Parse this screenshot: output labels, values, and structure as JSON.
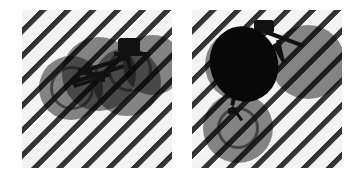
{
  "figure": {
    "canvas": {
      "width": 362,
      "height": 177,
      "background": "#ffffff"
    },
    "panel_count": 2
  },
  "palette": {
    "background": "#ffffff",
    "stripe_light": "#f4f4f4",
    "stripe_dark": "#313131",
    "proposal_fill": "#000000",
    "proposal_opacity": "0.46",
    "blob_fill": "#080808",
    "bicycle_fill": "#111111"
  },
  "stripe_pattern": {
    "name": "diagonal-stripes",
    "angle_deg": -45,
    "period_px": 17.6,
    "dark_band_px": 5,
    "light_band_px": 12
  },
  "panels": [
    {
      "id": "panel-left",
      "label": "Left panel",
      "x": 22,
      "y": 10,
      "width": 150,
      "height": 158,
      "proposals": [
        {
          "id": "prop-l1",
          "cx": 49,
          "cy": 78,
          "r": 32
        },
        {
          "id": "prop-l2",
          "cx": 77,
          "cy": 64,
          "r": 37
        },
        {
          "id": "prop-l3",
          "cx": 105,
          "cy": 72,
          "r": 34
        },
        {
          "id": "prop-l4",
          "cx": 131,
          "cy": 55,
          "r": 30
        }
      ],
      "blobs": [],
      "object_label": "bicycle"
    },
    {
      "id": "panel-right",
      "label": "Right panel",
      "x": 192,
      "y": 10,
      "width": 150,
      "height": 158,
      "proposals": [
        {
          "id": "prop-r1",
          "cx": 46,
          "cy": 118,
          "r": 35
        },
        {
          "id": "prop-r2",
          "cx": 49,
          "cy": 55,
          "r": 36
        },
        {
          "id": "prop-r3",
          "cx": 116,
          "cy": 52,
          "r": 37
        }
      ],
      "blobs": [
        {
          "id": "blob-r1",
          "cx": 52,
          "cy": 54,
          "rx": 34,
          "ry": 38,
          "rotate_deg": -18
        }
      ],
      "object_label": "bicycle"
    }
  ],
  "bicycle_left": {
    "name": "bicycle-silhouette-left",
    "parts": [
      {
        "id": "bl-rearwheel-rim",
        "type": "ring",
        "cx": 50,
        "cy": 78,
        "r": 22,
        "thickness": 3
      },
      {
        "id": "bl-frontwheel-rim",
        "type": "ring",
        "cx": 108,
        "cy": 60,
        "r": 22,
        "thickness": 3
      },
      {
        "id": "bl-toptube",
        "type": "stroke",
        "x1": 58,
        "y1": 62,
        "x2": 104,
        "y2": 48,
        "w": 4
      },
      {
        "id": "bl-downtube",
        "type": "stroke",
        "x1": 52,
        "y1": 72,
        "x2": 102,
        "y2": 56,
        "w": 4
      },
      {
        "id": "bl-seattube",
        "type": "stroke",
        "x1": 58,
        "y1": 62,
        "x2": 52,
        "y2": 76,
        "w": 4
      },
      {
        "id": "bl-chainstay",
        "type": "stroke",
        "x1": 52,
        "y1": 76,
        "x2": 88,
        "y2": 64,
        "w": 3
      },
      {
        "id": "bl-seatstay",
        "type": "stroke",
        "x1": 58,
        "y1": 60,
        "x2": 84,
        "y2": 66,
        "w": 3
      },
      {
        "id": "bl-forkblade",
        "type": "stroke",
        "x1": 104,
        "y1": 46,
        "x2": 110,
        "y2": 62,
        "w": 4
      },
      {
        "id": "bl-handlebar",
        "type": "stroke",
        "x1": 92,
        "y1": 44,
        "x2": 128,
        "y2": 44,
        "w": 4
      },
      {
        "id": "bl-saddle",
        "type": "blockA",
        "x": 56,
        "y": 58,
        "w": 14,
        "h": 7
      },
      {
        "id": "bl-headbox",
        "type": "blockB",
        "x": 96,
        "y": 28,
        "w": 22,
        "h": 14
      },
      {
        "id": "bl-stem",
        "type": "stroke",
        "x1": 106,
        "y1": 36,
        "x2": 106,
        "y2": 50,
        "w": 4
      },
      {
        "id": "bl-pedal",
        "type": "blockC",
        "x": 74,
        "y": 66,
        "w": 9,
        "h": 6
      }
    ]
  },
  "bicycle_right": {
    "name": "bicycle-silhouette-right",
    "parts": [
      {
        "id": "br-rearwheel-rim",
        "type": "ring",
        "cx": 46,
        "cy": 118,
        "r": 21,
        "thickness": 3
      },
      {
        "id": "br-toptube",
        "type": "stroke",
        "x1": 46,
        "y1": 76,
        "x2": 82,
        "y2": 38,
        "w": 4
      },
      {
        "id": "br-downtube",
        "type": "stroke",
        "x1": 40,
        "y1": 84,
        "x2": 80,
        "y2": 44,
        "w": 4
      },
      {
        "id": "br-seattube",
        "type": "stroke",
        "x1": 44,
        "y1": 80,
        "x2": 40,
        "y2": 96,
        "w": 4
      },
      {
        "id": "br-chainstay",
        "type": "stroke",
        "x1": 40,
        "y1": 96,
        "x2": 50,
        "y2": 110,
        "w": 3
      },
      {
        "id": "br-forkblade",
        "type": "stroke",
        "x1": 82,
        "y1": 34,
        "x2": 92,
        "y2": 52,
        "w": 4
      },
      {
        "id": "br-handlebar",
        "type": "stroke",
        "x1": 74,
        "y1": 22,
        "x2": 112,
        "y2": 36,
        "w": 4
      },
      {
        "id": "br-saddle",
        "type": "blockA",
        "x": 36,
        "y": 80,
        "w": 13,
        "h": 7
      },
      {
        "id": "br-headbox",
        "type": "blockB",
        "x": 62,
        "y": 10,
        "w": 20,
        "h": 13
      },
      {
        "id": "br-stem",
        "type": "stroke",
        "x1": 86,
        "y1": 30,
        "x2": 90,
        "y2": 48,
        "w": 4
      },
      {
        "id": "br-pedal",
        "type": "blockC",
        "x": 36,
        "y": 98,
        "w": 9,
        "h": 6
      }
    ]
  }
}
